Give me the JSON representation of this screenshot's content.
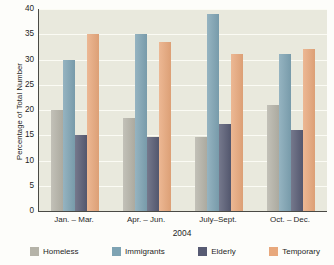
{
  "chart_data": {
    "type": "bar",
    "title": "",
    "xlabel": "2004",
    "ylabel": "Percentage of Total Number",
    "ylim": [
      0,
      40
    ],
    "ytick_values": [
      40,
      35,
      30,
      25,
      20,
      15,
      10,
      5,
      0
    ],
    "ytick_labels": [
      "40",
      "35",
      "30",
      "25",
      "20",
      "15",
      "10",
      "5",
      "0"
    ],
    "grid": true,
    "legend_position": "bottom",
    "categories": [
      "Jan. – Mar.",
      "Apr. – Jun.",
      "July–Sept.",
      "Oct. – Dec."
    ],
    "series": [
      {
        "name": "Homeless",
        "color": "#b5b3a8",
        "values": [
          20,
          18.5,
          14.7,
          21
        ]
      },
      {
        "name": "Immigrants",
        "color": "#7ea3b3",
        "values": [
          30,
          35,
          39,
          31
        ]
      },
      {
        "name": "Elderly",
        "color": "#575b73",
        "values": [
          15,
          14.7,
          17.3,
          16
        ]
      },
      {
        "name": "Temporary",
        "color": "#e8a87c",
        "values": [
          35,
          33.5,
          31,
          32
        ]
      }
    ]
  },
  "figure": {
    "plot_background": "#e9e9dd",
    "gridline_color": "#fbfbf4",
    "axis_color": "#4a4a45",
    "page_background": "#fdfdfa"
  }
}
